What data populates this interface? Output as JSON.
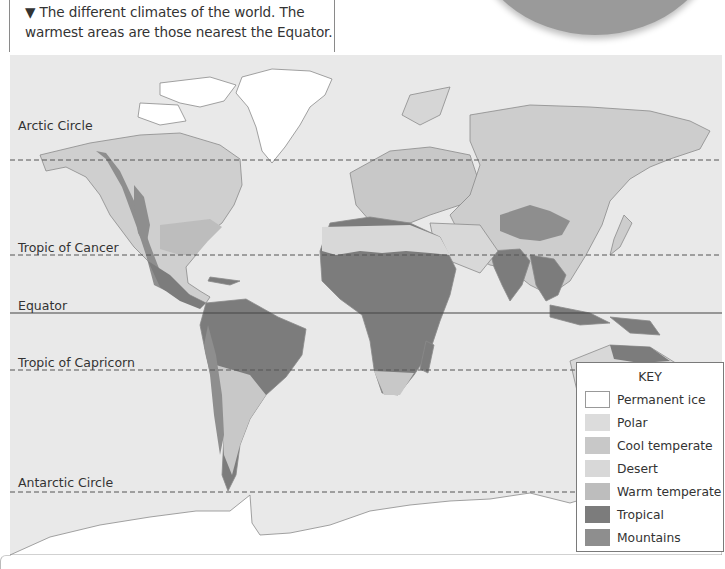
{
  "caption": {
    "marker": "▼",
    "line1": "▼ The different climates of the world. The",
    "line2": "warmest areas are those nearest the Equator."
  },
  "map": {
    "title": "World climate zones",
    "lines": [
      {
        "name": "arctic-circle",
        "label": "Arctic Circle",
        "y": 105,
        "style": "dashed"
      },
      {
        "name": "tropic-of-cancer",
        "label": "Tropic of Cancer",
        "y": 200,
        "style": "dashed"
      },
      {
        "name": "equator",
        "label": "Equator",
        "y": 258,
        "style": "solid"
      },
      {
        "name": "tropic-of-capricorn",
        "label": "Tropic of Capricorn",
        "y": 315,
        "style": "dashed"
      },
      {
        "name": "antarctic-circle",
        "label": "Antarctic Circle",
        "y": 437,
        "style": "dashed"
      }
    ]
  },
  "key": {
    "title": "KEY",
    "items": [
      {
        "label": "Permanent ice",
        "color": "#ffffff"
      },
      {
        "label": "Polar",
        "color": "#dcdcdc"
      },
      {
        "label": "Cool temperate",
        "color": "#c8c8c8"
      },
      {
        "label": "Desert",
        "color": "#d8d8d8"
      },
      {
        "label": "Warm temperate",
        "color": "#bdbdbd"
      },
      {
        "label": "Tropical",
        "color": "#7c7c7c"
      },
      {
        "label": "Mountains",
        "color": "#8e8e8e"
      }
    ]
  },
  "colors": {
    "ocean": "#e9e9e9",
    "coast": "#8a8a8a",
    "globe": "#9a9a9a"
  }
}
